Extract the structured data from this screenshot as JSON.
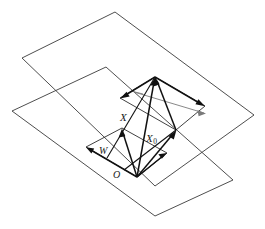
{
  "figure": {
    "background_color": "#ffffff",
    "line_color": "#3a3a3a",
    "vector_color": "#111111",
    "faint_color": "#7a7a7a",
    "width": 265,
    "height": 229
  },
  "labels": {
    "x": "X",
    "x0_base": "X",
    "x0_sub": "0",
    "w": "W",
    "o": "O"
  },
  "geometry": {
    "upper_plane": {
      "name": "upper-plane",
      "points": "115,12 254,115 155,186 22,58"
    },
    "lower_plane": {
      "name": "lower-plane",
      "points": "106,67 233,180 155,216 12,111"
    },
    "upper_subspace": {
      "name": "upper-subspace",
      "points": "155,77 205,106 176,130 120,98"
    },
    "lower_subspace": {
      "name": "lower-subspace",
      "points": "122,128 167,153 137,177 86,147"
    },
    "apex": "155,77",
    "origin": "137,177"
  },
  "vectors": [
    {
      "name": "vector-x",
      "label": "X",
      "from": "137,177",
      "to": "155,77"
    },
    {
      "name": "vector-x0",
      "label": "X0",
      "from": "137,177",
      "to": "176,130"
    },
    {
      "name": "vector-w",
      "label": "W",
      "from": "137,177",
      "to": "122,128"
    },
    {
      "name": "vector-x0-to-apex",
      "label": "",
      "from": "176,130",
      "to": "155,77"
    },
    {
      "name": "vector-subspace-upper-left",
      "label": "",
      "from": "155,77",
      "to": "120,98"
    },
    {
      "name": "vector-subspace-upper-right",
      "label": "",
      "from": "155,77",
      "to": "205,106"
    },
    {
      "name": "vector-subspace-lower-left",
      "label": "",
      "from": "137,177",
      "to": "86,147"
    },
    {
      "name": "vector-subspace-lower-right",
      "label": "",
      "from": "137,177",
      "to": "167,153"
    },
    {
      "name": "vector-diagonal-left",
      "label": "",
      "from": "155,77",
      "to": "107,158"
    },
    {
      "name": "vector-diagonal-right",
      "label": "",
      "from": "176,130",
      "to": "124,170"
    }
  ]
}
